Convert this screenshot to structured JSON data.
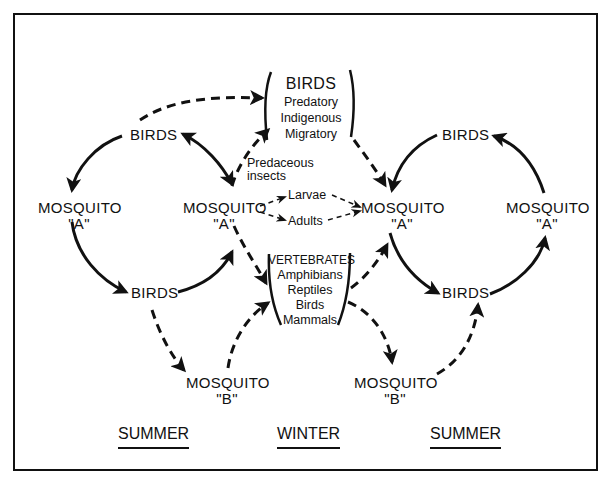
{
  "diagram": {
    "type": "mosquito-bird transmission cycle",
    "seasons": {
      "left": "SUMMER",
      "center": "WINTER",
      "right": "SUMMER"
    },
    "left_cycle": {
      "birds_top": "BIRDS",
      "mosquito": {
        "name": "MOSQUITO",
        "tag": "\"A\""
      },
      "birds_bottom": "BIRDS",
      "mosquito_b": {
        "name": "MOSQUITO",
        "tag": "\"B\""
      }
    },
    "center": {
      "birds_group": {
        "title": "BIRDS",
        "items": [
          "Predatory",
          "Indigenous",
          "Migratory"
        ]
      },
      "predaceous": [
        "Predaceous",
        "insects"
      ],
      "mosquito_left": {
        "name": "MOSQUITO",
        "tag": "\"A\""
      },
      "mosquito_right": {
        "name": "MOSQUITO",
        "tag": "\"A\""
      },
      "larvae": "Larvae",
      "adults": "Adults",
      "vertebrates_group": {
        "title": "VERTEBRATES",
        "items": [
          "Amphibians",
          "Reptiles",
          "Birds",
          "Mammals"
        ]
      }
    },
    "right_cycle": {
      "birds_top": "BIRDS",
      "mosquito": {
        "name": "MOSQUITO",
        "tag": "\"A\""
      },
      "birds_bottom": "BIRDS",
      "mosquito_b": {
        "name": "MOSQUITO",
        "tag": "\"B\""
      }
    },
    "legend": {
      "solid_arrow": "primary transmission",
      "dashed_arrow": "secondary / overwintering pathway"
    },
    "colors": {
      "ink": "#111111",
      "paper": "#ffffff"
    }
  }
}
